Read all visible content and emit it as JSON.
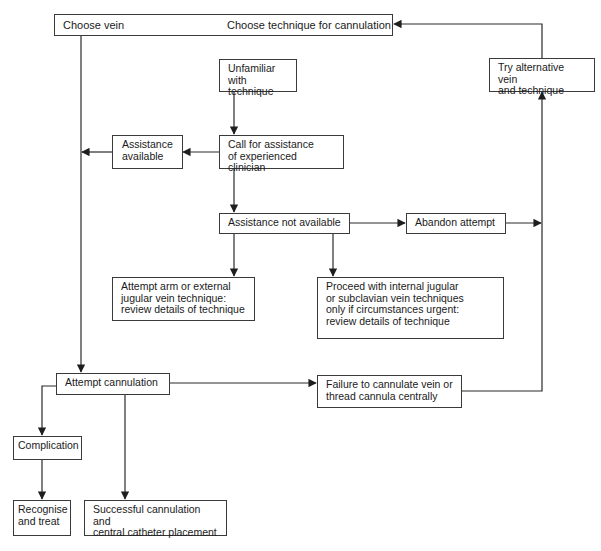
{
  "diagram": {
    "type": "flowchart",
    "line_color": "#2a2a2a",
    "background": "#ffffff",
    "nodes": {
      "choose_vein": "Choose vein",
      "choose_technique": "Choose technique for cannulation",
      "unfamiliar": "Unfamiliar\nwith technique",
      "call_assistance": "Call for assistance\nof experienced clinician",
      "assistance_available": "Assistance\navailable",
      "assistance_not_available": "Assistance not available",
      "abandon_attempt": "Abandon attempt",
      "try_alternative": "Try alternative vein\nand technique",
      "attempt_arm": "Attempt arm or external\njugular vein technique:\nreview details of technique",
      "proceed_internal": "Proceed with internal jugular\nor subclavian vein techniques\nonly if circumstances urgent:\n review details of technique",
      "attempt_cannulation": "Attempt cannulation",
      "failure": "Failure to cannulate vein or\nthread cannula centrally",
      "complication": "Complication",
      "recognise_treat": "Recognise\nand treat",
      "successful": "Successful cannulation and\ncentral catheter placement"
    },
    "edges": [
      {
        "from": "choose_vein",
        "to": "attempt_cannulation"
      },
      {
        "from": "unfamiliar",
        "to": "call_assistance"
      },
      {
        "from": "call_assistance",
        "to": "assistance_available"
      },
      {
        "from": "assistance_available",
        "to": "choose_vein_line"
      },
      {
        "from": "call_assistance",
        "to": "assistance_not_available"
      },
      {
        "from": "assistance_not_available",
        "to": "abandon_attempt"
      },
      {
        "from": "abandon_attempt",
        "to": "try_alternative_line"
      },
      {
        "from": "assistance_not_available",
        "to": "attempt_arm"
      },
      {
        "from": "assistance_not_available",
        "to": "proceed_internal"
      },
      {
        "from": "attempt_cannulation",
        "to": "failure"
      },
      {
        "from": "failure",
        "to": "try_alternative"
      },
      {
        "from": "try_alternative",
        "to": "choose_technique"
      },
      {
        "from": "attempt_cannulation",
        "to": "complication"
      },
      {
        "from": "complication",
        "to": "recognise_treat"
      },
      {
        "from": "attempt_cannulation",
        "to": "successful"
      }
    ]
  }
}
